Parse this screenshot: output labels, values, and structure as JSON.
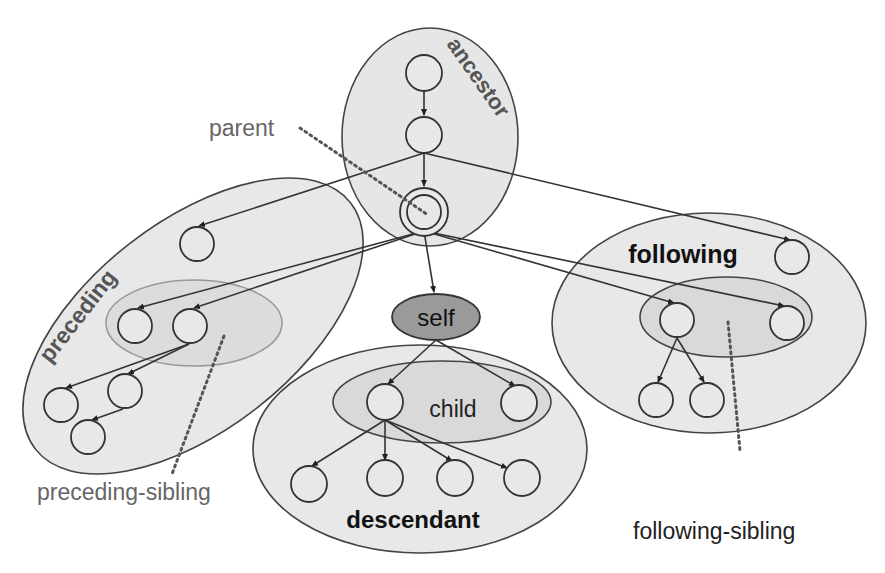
{
  "diagram": {
    "colors": {
      "background": "#ffffff",
      "region_fill": "#e6e6e6",
      "inner_region_fill": "#d9d9d9",
      "self_fill": "#9a9a9a",
      "stroke": "#333333",
      "gray_label": "#666666",
      "dark_label": "#111111"
    },
    "axes": {
      "ancestor": "ancestor",
      "parent": "parent",
      "self": "self",
      "child": "child",
      "descendant": "descendant",
      "preceding": "preceding",
      "preceding_sibling": "preceding-sibling",
      "following": "following",
      "following_sibling": "following-sibling"
    },
    "nodes": [
      {
        "id": "a1",
        "axis": "ancestor",
        "x": 424,
        "y": 73
      },
      {
        "id": "a2",
        "axis": "ancestor",
        "x": 424,
        "y": 135
      },
      {
        "id": "p",
        "axis": "parent",
        "x": 424,
        "y": 212
      },
      {
        "id": "pr1",
        "axis": "preceding",
        "x": 197,
        "y": 244
      },
      {
        "id": "ps1",
        "axis": "preceding-sibling",
        "x": 135,
        "y": 326
      },
      {
        "id": "ps2",
        "axis": "preceding-sibling",
        "x": 190,
        "y": 326
      },
      {
        "id": "pr2",
        "axis": "preceding",
        "x": 61,
        "y": 405
      },
      {
        "id": "pr3",
        "axis": "preceding",
        "x": 125,
        "y": 391
      },
      {
        "id": "pr4",
        "axis": "preceding",
        "x": 88,
        "y": 437
      },
      {
        "id": "c1",
        "axis": "child",
        "x": 385,
        "y": 402
      },
      {
        "id": "c2",
        "axis": "child",
        "x": 519,
        "y": 403
      },
      {
        "id": "d1",
        "axis": "descendant",
        "x": 309,
        "y": 484
      },
      {
        "id": "d2",
        "axis": "descendant",
        "x": 385,
        "y": 478
      },
      {
        "id": "d3",
        "axis": "descendant",
        "x": 455,
        "y": 478
      },
      {
        "id": "d4",
        "axis": "descendant",
        "x": 522,
        "y": 478
      },
      {
        "id": "f1",
        "axis": "following",
        "x": 792,
        "y": 257
      },
      {
        "id": "fs1",
        "axis": "following-sibling",
        "x": 677,
        "y": 320
      },
      {
        "id": "fs2",
        "axis": "following-sibling",
        "x": 787,
        "y": 323
      },
      {
        "id": "f2",
        "axis": "following",
        "x": 656,
        "y": 400
      },
      {
        "id": "f3",
        "axis": "following",
        "x": 707,
        "y": 400
      }
    ],
    "edges": [
      [
        "a1",
        "a2"
      ],
      [
        "a2",
        "p"
      ],
      [
        "a2",
        "pr1"
      ],
      [
        "a2",
        "f1"
      ],
      [
        "p",
        "ps1"
      ],
      [
        "p",
        "ps2"
      ],
      [
        "p",
        "self"
      ],
      [
        "p",
        "fs1"
      ],
      [
        "p",
        "fs2"
      ],
      [
        "ps2",
        "pr2"
      ],
      [
        "ps2",
        "pr3"
      ],
      [
        "pr3",
        "pr4"
      ],
      [
        "self",
        "c1"
      ],
      [
        "self",
        "c2"
      ],
      [
        "c1",
        "d1"
      ],
      [
        "c1",
        "d2"
      ],
      [
        "c1",
        "d3"
      ],
      [
        "c1",
        "d4"
      ],
      [
        "fs1",
        "f2"
      ],
      [
        "fs1",
        "f3"
      ]
    ]
  }
}
